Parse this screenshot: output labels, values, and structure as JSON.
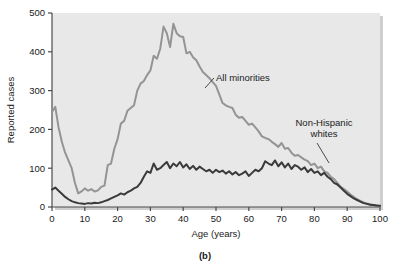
{
  "chart_data": {
    "type": "line",
    "title": "",
    "subtitle": "",
    "caption": "(b)",
    "xlabel": "Age (years)",
    "ylabel": "Reported cases",
    "xlim": [
      0,
      100
    ],
    "ylim": [
      0,
      500
    ],
    "xticks": [
      0,
      10,
      20,
      30,
      40,
      50,
      60,
      70,
      80,
      90,
      100
    ],
    "yticks": [
      0,
      100,
      200,
      300,
      400,
      500
    ],
    "xtick_labels": [
      "0",
      "10",
      "20",
      "30",
      "40",
      "50",
      "60",
      "70",
      "80",
      "90",
      "100"
    ],
    "ytick_labels": [
      "0",
      "100",
      "200",
      "300",
      "400",
      "500"
    ],
    "grid": false,
    "legend_position": "inline-annotation",
    "plot_background": "#e8e8e8",
    "x": [
      0,
      1,
      2,
      3,
      4,
      5,
      6,
      7,
      8,
      9,
      10,
      11,
      12,
      13,
      14,
      15,
      16,
      17,
      18,
      19,
      20,
      21,
      22,
      23,
      24,
      25,
      26,
      27,
      28,
      29,
      30,
      31,
      32,
      33,
      34,
      35,
      36,
      37,
      38,
      39,
      40,
      41,
      42,
      43,
      44,
      45,
      46,
      47,
      48,
      49,
      50,
      51,
      52,
      53,
      54,
      55,
      56,
      57,
      58,
      59,
      60,
      61,
      62,
      63,
      64,
      65,
      66,
      67,
      68,
      69,
      70,
      71,
      72,
      73,
      74,
      75,
      76,
      77,
      78,
      79,
      80,
      81,
      82,
      83,
      84,
      85,
      86,
      87,
      88,
      89,
      90,
      91,
      92,
      93,
      94,
      95,
      96,
      97,
      98,
      99,
      100
    ],
    "series": [
      {
        "name": "All minorities",
        "color": "#949494",
        "annotation": "All minorities",
        "annotation_x": 46,
        "annotation_y": 330,
        "values": [
          245,
          258,
          205,
          168,
          140,
          120,
          100,
          62,
          35,
          40,
          48,
          42,
          46,
          40,
          43,
          52,
          55,
          108,
          112,
          150,
          175,
          215,
          222,
          248,
          255,
          262,
          300,
          318,
          325,
          340,
          352,
          390,
          382,
          408,
          465,
          448,
          412,
          472,
          448,
          440,
          438,
          396,
          400,
          386,
          378,
          362,
          348,
          340,
          332,
          322,
          312,
          290,
          268,
          262,
          258,
          255,
          238,
          230,
          232,
          222,
          212,
          215,
          205,
          195,
          182,
          178,
          175,
          168,
          162,
          155,
          165,
          150,
          152,
          140,
          132,
          134,
          128,
          122,
          118,
          108,
          112,
          100,
          104,
          92,
          88,
          78,
          72,
          62,
          52,
          46,
          40,
          32,
          26,
          20,
          16,
          12,
          9,
          7,
          5,
          3,
          2
        ]
      },
      {
        "name": "Non-Hispanic whites",
        "color": "#3a3a3a",
        "annotation": "Non-Hispanic\nwhites",
        "annotation_x": 82,
        "annotation_y": 215,
        "values": [
          45,
          50,
          42,
          34,
          26,
          20,
          15,
          12,
          10,
          9,
          8,
          10,
          9,
          11,
          10,
          12,
          15,
          18,
          22,
          26,
          30,
          35,
          32,
          38,
          42,
          48,
          52,
          62,
          78,
          92,
          88,
          112,
          96,
          100,
          108,
          116,
          100,
          112,
          105,
          116,
          102,
          110,
          98,
          106,
          96,
          104,
          98,
          92,
          96,
          88,
          96,
          90,
          94,
          86,
          92,
          84,
          90,
          82,
          86,
          92,
          80,
          88,
          96,
          92,
          100,
          118,
          112,
          108,
          120,
          105,
          115,
          102,
          112,
          98,
          108,
          104,
          96,
          102,
          90,
          98,
          88,
          92,
          82,
          88,
          78,
          72,
          62,
          58,
          50,
          42,
          34,
          28,
          22,
          18,
          14,
          10,
          8,
          6,
          5,
          4,
          3
        ]
      }
    ]
  },
  "axes": {
    "y_title": "Reported cases",
    "x_title": "Age (years)"
  },
  "figure": {
    "caption": "(b)"
  }
}
